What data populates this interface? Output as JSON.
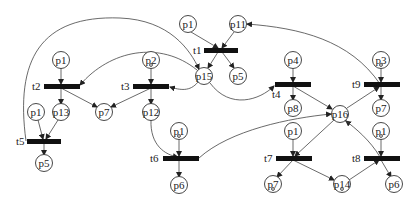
{
  "diagram": {
    "type": "petri-net",
    "places": [
      {
        "id": "pl_t1_p1",
        "label": "p1",
        "x": 188,
        "y": 24,
        "token": false
      },
      {
        "id": "pl_t1_p11",
        "label": "p11",
        "x": 238,
        "y": 24,
        "token": false
      },
      {
        "id": "pl_t1_p5",
        "label": "p5",
        "x": 238,
        "y": 76,
        "token": false
      },
      {
        "id": "pl_p15",
        "label": "p15",
        "x": 204,
        "y": 76,
        "token": false
      },
      {
        "id": "pl_t2_p1",
        "label": "p1",
        "x": 61,
        "y": 60,
        "token": false
      },
      {
        "id": "pl_p13",
        "label": "p13",
        "x": 61,
        "y": 112,
        "token": false
      },
      {
        "id": "pl_t2_p7",
        "label": "p7",
        "x": 104,
        "y": 112,
        "token": false
      },
      {
        "id": "pl_p2",
        "label": "p2",
        "x": 151,
        "y": 60,
        "token": true
      },
      {
        "id": "pl_p12",
        "label": "p12",
        "x": 151,
        "y": 112,
        "token": false
      },
      {
        "id": "pl_t5_p1",
        "label": "p1",
        "x": 36,
        "y": 112,
        "token": false
      },
      {
        "id": "pl_t5_p5",
        "label": "p5",
        "x": 44,
        "y": 163,
        "token": false
      },
      {
        "id": "pl_t6_p1",
        "label": "p1",
        "x": 179,
        "y": 131,
        "token": true
      },
      {
        "id": "pl_t6_p6",
        "label": "p6",
        "x": 179,
        "y": 185,
        "token": false
      },
      {
        "id": "pl_p4",
        "label": "p4",
        "x": 293,
        "y": 60,
        "token": false
      },
      {
        "id": "pl_p8",
        "label": "p8",
        "x": 293,
        "y": 108,
        "token": false
      },
      {
        "id": "pl_p16",
        "label": "p16",
        "x": 340,
        "y": 114,
        "token": false
      },
      {
        "id": "pl_p3",
        "label": "p3",
        "x": 381,
        "y": 60,
        "token": true
      },
      {
        "id": "pl_t9_p7",
        "label": "p7",
        "x": 381,
        "y": 108,
        "token": false
      },
      {
        "id": "pl_t7_p1",
        "label": "p1",
        "x": 293,
        "y": 131,
        "token": false
      },
      {
        "id": "pl_t8_p1",
        "label": "p1",
        "x": 381,
        "y": 131,
        "token": true
      },
      {
        "id": "pl_t7_p7",
        "label": "p7",
        "x": 273,
        "y": 184,
        "token": true
      },
      {
        "id": "pl_p14",
        "label": "p14",
        "x": 342,
        "y": 184,
        "token": true
      },
      {
        "id": "pl_t8_p6",
        "label": "p6",
        "x": 394,
        "y": 184,
        "token": false
      }
    ],
    "transitions": [
      {
        "id": "t1",
        "label": "t1",
        "x": 204,
        "y": 50,
        "w": 34
      },
      {
        "id": "t2",
        "label": "t2",
        "x": 44,
        "y": 86,
        "w": 36
      },
      {
        "id": "t3",
        "label": "t3",
        "x": 133,
        "y": 86,
        "w": 36
      },
      {
        "id": "t4",
        "label": "t4",
        "x": 275,
        "y": 84,
        "w": 36
      },
      {
        "id": "t5",
        "label": "t5",
        "x": 27,
        "y": 141,
        "w": 34
      },
      {
        "id": "t6",
        "label": "t6",
        "x": 163,
        "y": 158,
        "w": 36
      },
      {
        "id": "t7",
        "label": "t7",
        "x": 276,
        "y": 158,
        "w": 36
      },
      {
        "id": "t8",
        "label": "t8",
        "x": 364,
        "y": 158,
        "w": 36
      },
      {
        "id": "t9",
        "label": "t9",
        "x": 364,
        "y": 84,
        "w": 36
      }
    ]
  }
}
